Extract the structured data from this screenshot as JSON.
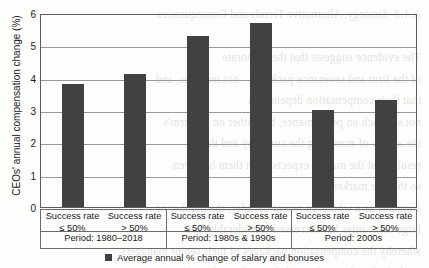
{
  "chart_data": {
    "type": "bar",
    "title": "",
    "xlabel": "",
    "ylabel": "CEOs' annual compensation change (%)",
    "ylim": [
      0,
      6
    ],
    "yticks": [
      "0",
      "1",
      "2",
      "3",
      "4",
      "5",
      "6"
    ],
    "grid": true,
    "legend_position": "bottom",
    "categories": [
      "Success rate ≤ 50%",
      "Success rate > 50%",
      "Success rate ≤ 50%",
      "Success rate > 50%",
      "Success rate ≤ 50%",
      "Success rate > 50%"
    ],
    "category_lines": [
      [
        "Success rate",
        "≤ 50%"
      ],
      [
        "Success rate",
        "> 50%"
      ],
      [
        "Success rate",
        "≤ 50%"
      ],
      [
        "Success rate",
        "> 50%"
      ],
      [
        "Success rate",
        "≤ 50%"
      ],
      [
        "Success rate",
        "> 50%"
      ]
    ],
    "groups": [
      {
        "label": "Period: 1980–2018",
        "span": 2
      },
      {
        "label": "Period: 1980s & 1990s",
        "span": 2
      },
      {
        "label": "Period: 2000s",
        "span": 2
      }
    ],
    "series": [
      {
        "name": "Average annual % change of salary and bonuses",
        "values": [
          3.8,
          4.1,
          5.3,
          5.7,
          3.0,
          3.3
        ],
        "color": "#414141"
      }
    ]
  },
  "legend": {
    "entries": [
      {
        "label": "Average annual % change of salary and bonuses",
        "color": "#414141"
      }
    ]
  },
  "axis": {
    "y_label": "CEOs' annual compensation change (%)",
    "y_ticks": [
      "6",
      "5",
      "4",
      "3",
      "2",
      "1",
      "0"
    ]
  },
  "background_bleed": "A.1.3  Strategy, Alternative Trends and Consequences\n\nThe evidence suggests that the corporate\nof the firm and severance packages - not incomes, and\nthat their compensation depends on\nnot so much on performance, but rather on the firm's\nthe ability of managing the company and the\nresults that the market expects from them has been\nso that the market can\ncompany as a whole. In recent decades, the number of\nlarge companies has increased considerably, and\nwhereby the compensation packages of their senior managers\nare linked to the profits and the market value of\nstock options. Nonetheless, the available\nevidence in a new framework."
}
